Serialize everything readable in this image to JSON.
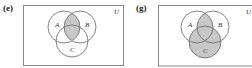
{
  "panels": [
    {
      "label": "(e)",
      "universe_label": "U",
      "set_labels": {
        "A": "A",
        "B": "B",
        "C": "C"
      },
      "shaded_region": "A ∩ B"
    },
    {
      "label": "(g)",
      "universe_label": "U",
      "set_labels": {
        "A": "A",
        "B": "B",
        "C": "C"
      },
      "shaded_region": "(A ∩ B) ∪ C"
    }
  ],
  "colors": {
    "shade": "#c8c8c8",
    "stroke": "#666666",
    "frame": "#888888"
  }
}
